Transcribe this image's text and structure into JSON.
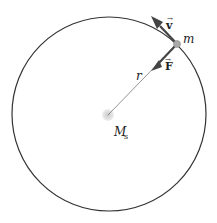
{
  "diagram": {
    "orbit": {
      "cx": 109,
      "cy": 114,
      "r": 97,
      "stroke": "#333333"
    },
    "central_body": {
      "label_main": "M",
      "label_sub": "s",
      "x": 108,
      "y": 115
    },
    "orbiting_body": {
      "label": "m",
      "x": 177,
      "y": 44
    },
    "radius_label": "r",
    "velocity_label": "v",
    "force_label": "F",
    "colors": {
      "arrow": "#444444",
      "line": "#555555",
      "body": "#b0b0b0",
      "center_glow": "#d9d9d9"
    }
  }
}
